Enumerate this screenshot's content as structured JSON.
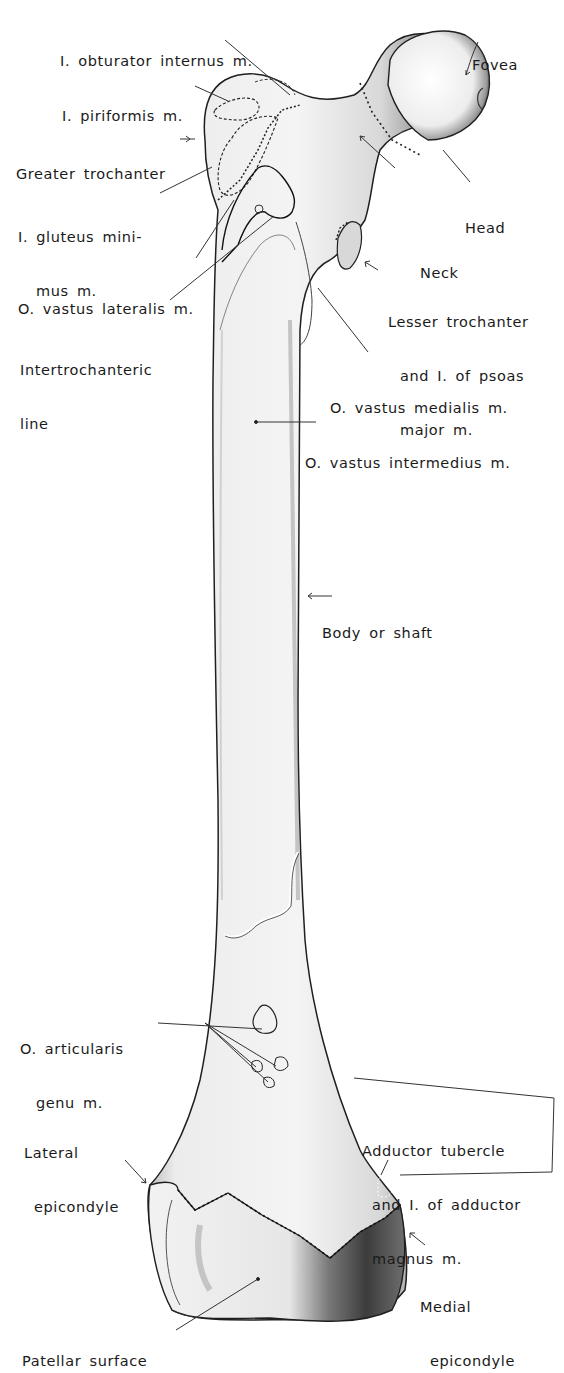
{
  "figure": {
    "labels": [
      {
        "id": "obturator-internus",
        "lines": [
          "I. obturator internus m."
        ]
      },
      {
        "id": "fovea",
        "lines": [
          "Fovea"
        ]
      },
      {
        "id": "piriformis",
        "lines": [
          "I. piriformis m."
        ]
      },
      {
        "id": "greater-trochanter",
        "lines": [
          "Greater trochanter"
        ]
      },
      {
        "id": "gluteus-minimus",
        "lines": [
          "I. gluteus mini-",
          "mus m."
        ]
      },
      {
        "id": "head",
        "lines": [
          "Head"
        ]
      },
      {
        "id": "neck",
        "lines": [
          "Neck"
        ]
      },
      {
        "id": "vastus-lateralis",
        "lines": [
          "O. vastus lateralis m."
        ]
      },
      {
        "id": "lesser-trochanter",
        "lines": [
          "Lesser trochanter",
          "and I. of psoas",
          "major m."
        ]
      },
      {
        "id": "intertrochanteric-line",
        "lines": [
          "Intertrochanteric",
          "line"
        ]
      },
      {
        "id": "vastus-medialis",
        "lines": [
          "O. vastus medialis m."
        ]
      },
      {
        "id": "vastus-intermedius",
        "lines": [
          "O. vastus intermedius m."
        ]
      },
      {
        "id": "body-or-shaft",
        "lines": [
          "Body or shaft"
        ]
      },
      {
        "id": "articularis-genu",
        "lines": [
          "O. articularis",
          "genu m."
        ]
      },
      {
        "id": "lateral-epicondyle",
        "lines": [
          "Lateral",
          "epicondyle"
        ]
      },
      {
        "id": "adductor-tubercle",
        "lines": [
          "Adductor tubercle",
          "and I. of adductor",
          "magnus m."
        ]
      },
      {
        "id": "medial-epicondyle",
        "lines": [
          "Medial",
          "epicondyle"
        ]
      },
      {
        "id": "patellar-surface",
        "lines": [
          "Patellar surface"
        ]
      }
    ]
  }
}
